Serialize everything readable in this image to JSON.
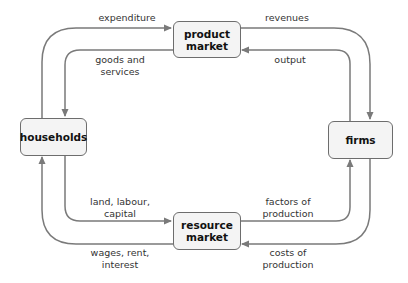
{
  "diagram": {
    "type": "circular-flow",
    "colors": {
      "arrow": "#7a7a7a",
      "box_fill": "#f4f4f4",
      "box_border": "#6d6d6d",
      "text": "#333333"
    },
    "nodes": {
      "product_market": {
        "line1": "product",
        "line2": "market"
      },
      "households": {
        "label": "households"
      },
      "firms": {
        "label": "firms"
      },
      "resource_market": {
        "line1": "resource",
        "line2": "market"
      }
    },
    "flows": {
      "expenditure": "expenditure",
      "goods_services_1": "goods and",
      "goods_services_2": "services",
      "revenues": "revenues",
      "output": "output",
      "land_1": "land, labour,",
      "land_2": "capital",
      "wages_1": "wages, rent,",
      "wages_2": "interest",
      "factors_1": "factors of",
      "factors_2": "production",
      "costs_1": "costs of",
      "costs_2": "production"
    }
  }
}
